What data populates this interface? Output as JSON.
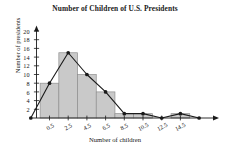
{
  "chart_data": {
    "type": "bar",
    "title": "Number of Children of U.S. Presidents",
    "xlabel": "Number of children",
    "ylabel": "Number of presidents",
    "categories": [
      "0.5",
      "2.5",
      "4.5",
      "6.5",
      "8.5",
      "10.5",
      "12.5",
      "14.5"
    ],
    "values": [
      8,
      15,
      10,
      6,
      1,
      1,
      0,
      1
    ],
    "x": [
      0.5,
      2.5,
      4.5,
      6.5,
      8.5,
      10.5,
      12.5,
      14.5
    ],
    "series": [
      {
        "name": "Frequency polygon",
        "x": [
          -1.5,
          0.5,
          2.5,
          4.5,
          6.5,
          8.5,
          10.5,
          12.5,
          14.5,
          16.5
        ],
        "values": [
          0,
          8,
          15,
          10,
          6,
          1,
          1,
          0,
          1,
          0
        ]
      }
    ],
    "xtick_labels": [
      "0.5",
      "2.5",
      "4.5",
      "6.5",
      "8.5",
      "10.5",
      "12.5",
      "14.5"
    ],
    "ytick_labels": [
      "2",
      "4",
      "6",
      "8",
      "10",
      "12",
      "14",
      "16",
      "18",
      "20"
    ],
    "ytick_values": [
      2,
      4,
      6,
      8,
      10,
      12,
      14,
      16,
      18,
      20
    ],
    "xlim": [
      -2.5,
      17.5
    ],
    "ylim": [
      0,
      21
    ],
    "grid": false,
    "legend": "none",
    "bar_color": "#c9c9c9",
    "bar_edge_color": "#8f8f8f",
    "line_color": "#1a1a1a",
    "marker": "filled-circle",
    "axis_arrows": true
  }
}
